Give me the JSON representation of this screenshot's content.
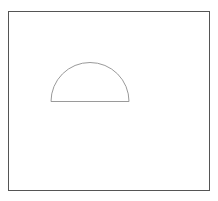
{
  "canvas": {
    "width": 218,
    "height": 201,
    "background_color": "#ffffff"
  },
  "figure": {
    "title": "Semicircle inside a rectangular frame",
    "shapes": [
      {
        "id": "frame",
        "name": "outer-rectangle",
        "type": "rectangle",
        "x": 8,
        "y": 11,
        "width": 201,
        "height": 179,
        "stroke_color": "#555555",
        "stroke_width": 1,
        "fill_color": "none"
      },
      {
        "id": "semicircle",
        "name": "semicircle",
        "type": "semicircle",
        "center_x": 90,
        "baseline_y": 101,
        "radius": 39,
        "left_x": 51,
        "right_x": 129,
        "apex_y": 62,
        "orientation": "flat-side-down",
        "stroke_color": "#9a9a9a",
        "stroke_width": 1,
        "fill_color": "none"
      }
    ]
  }
}
